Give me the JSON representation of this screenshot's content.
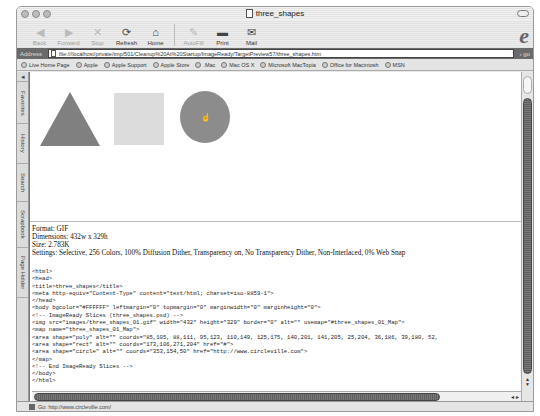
{
  "window": {
    "title": "three_shapes"
  },
  "toolbar": {
    "buttons": [
      {
        "label": "Back",
        "icon": "back-arrow-icon",
        "enabled": false
      },
      {
        "label": "Forward",
        "icon": "forward-arrow-icon",
        "enabled": false
      },
      {
        "label": "Stop",
        "icon": "stop-x-icon",
        "enabled": false
      },
      {
        "label": "Refresh",
        "icon": "refresh-icon",
        "enabled": true
      },
      {
        "label": "Home",
        "icon": "home-icon",
        "enabled": true
      },
      {
        "label": "AutoFill",
        "icon": "autofill-icon",
        "enabled": false
      },
      {
        "label": "Print",
        "icon": "print-icon",
        "enabled": true
      },
      {
        "label": "Mail",
        "icon": "mail-icon",
        "enabled": true
      }
    ]
  },
  "address": {
    "label": "Address",
    "value": "file:///localhost/private/tmp/501/Cleanup%20At%20Startup/ImageReady/TargetPreview57/three_shapes.htm",
    "go_label": "go"
  },
  "favorites": [
    "Live Home Page",
    "Apple",
    "Apple Support",
    "Apple Store",
    ".Mac",
    "Mac OS X",
    "Microsoft MacTopia",
    "Office for Macintosh",
    "MSN"
  ],
  "sidetabs": [
    "Favorites",
    "History",
    "Search",
    "Scrapbook",
    "Page Holder"
  ],
  "info": {
    "format": "Format: GIF",
    "dimensions": "Dimensions: 432w x 329h",
    "size": "Size: 2.783K",
    "settings": "Settings: Selective, 256 Colors, 100% Diffusion Dither, Transparency on, No Transparency Dither, Non-Interlaced, 0% Web Snap"
  },
  "code_lines": [
    "<html>",
    "<head>",
    "<title>three_shapes</title>",
    "<meta http-equiv=\"Content-Type\" content=\"text/html; charset=iso-8859-1\">",
    "</head>",
    "<body bgcolor=\"#FFFFFF\" leftmargin=\"0\" topmargin=\"0\" marginwidth=\"0\" marginheight=\"0\">",
    "<!-- ImageReady Slices (three_shapes.psd) -->",
    "<img src=\"images/three_shapes_01.gif\" width=\"432\" height=\"329\" border=\"0\" alt=\"\" usemap=\"#three_shapes_01_Map\">",
    "<map name=\"three_shapes_01_Map\">",
    "<area shape=\"poly\" alt=\"\" coords=\"85,105, 88,111, 95,123, 110,149, 125,175, 140,201, 141,205, 25,204, 36,186, 39,180, 52,",
    "<area shape=\"rect\" alt=\"\" coords=\"173,106,271,204\" href=\"#\">",
    "<area shape=\"circle\" alt=\"\" coords=\"353,154,50\" href=\"http://www.circleville.com\">",
    "</map>",
    "<!-- End ImageReady Slices -->",
    "</body>",
    "</html>"
  ],
  "status": {
    "text": "Go: http://www.circleville.com/"
  }
}
